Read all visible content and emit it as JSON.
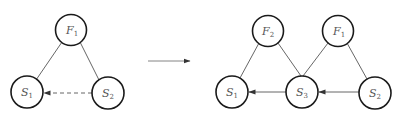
{
  "colors": {
    "node_stroke": "#1a1a1a",
    "edge": "#555555",
    "text": "#555555",
    "background": "#ffffff"
  },
  "left_diagram": {
    "nodes": [
      {
        "id": "F1",
        "base": "F",
        "sub": "1",
        "cx": 71,
        "cy": 30
      },
      {
        "id": "S1",
        "base": "S",
        "sub": "1",
        "cx": 27,
        "cy": 92
      },
      {
        "id": "S2",
        "base": "S",
        "sub": "2",
        "cx": 108,
        "cy": 93
      }
    ],
    "edges": [
      {
        "from": "F1",
        "to": "S1",
        "style": "solid",
        "arrow": false
      },
      {
        "from": "F1",
        "to": "S2",
        "style": "solid",
        "arrow": false
      },
      {
        "from": "S2",
        "to": "S1",
        "style": "dashed",
        "arrow": true
      }
    ]
  },
  "transition_arrow": {
    "x1": 148,
    "y1": 61,
    "x2": 190,
    "y2": 61
  },
  "right_diagram": {
    "nodes": [
      {
        "id": "F2",
        "base": "F",
        "sub": "2",
        "cx": 268,
        "cy": 31
      },
      {
        "id": "F1",
        "base": "F",
        "sub": "1",
        "cx": 338,
        "cy": 31
      },
      {
        "id": "S1",
        "base": "S",
        "sub": "1",
        "cx": 232,
        "cy": 92
      },
      {
        "id": "S3",
        "base": "S",
        "sub": "3",
        "cx": 302,
        "cy": 92
      },
      {
        "id": "S2",
        "base": "S",
        "sub": "2",
        "cx": 375,
        "cy": 93
      }
    ],
    "edges": [
      {
        "from": "F2",
        "to": "S1",
        "style": "solid",
        "arrow": false
      },
      {
        "from": "F2",
        "to": "S3",
        "style": "solid",
        "arrow": false
      },
      {
        "from": "F1",
        "to": "S3",
        "style": "solid",
        "arrow": false
      },
      {
        "from": "F1",
        "to": "S2",
        "style": "solid",
        "arrow": false
      },
      {
        "from": "S3",
        "to": "S1",
        "style": "solid",
        "arrow": true
      },
      {
        "from": "S2",
        "to": "S3",
        "style": "solid",
        "arrow": true
      }
    ]
  }
}
